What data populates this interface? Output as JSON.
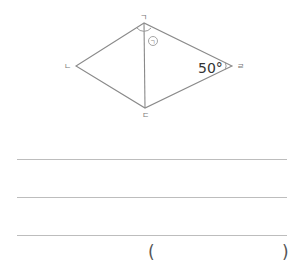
{
  "figure": {
    "shape": "rhombus with diagonal",
    "vertices": {
      "top": {
        "label": "ㄱ",
        "x": 144,
        "y": 23
      },
      "left": {
        "label": "ㄴ",
        "x": 76,
        "y": 66
      },
      "bottom": {
        "label": "ㄷ",
        "x": 145,
        "y": 108
      },
      "right": {
        "label": "ㄹ",
        "x": 232,
        "y": 66
      }
    },
    "angle_mark_label": "㉠",
    "angle_value_label": "50°",
    "line_color": "#8a8a8a"
  },
  "answer": {
    "lines_count": 3,
    "open_paren": "(",
    "close_paren": ")",
    "value": ""
  }
}
